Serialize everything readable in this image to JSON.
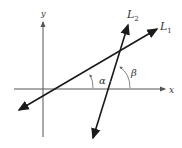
{
  "diagram": {
    "type": "coordinate-geometry",
    "axes": {
      "x_label": "x",
      "y_label": "y",
      "color": "#555555"
    },
    "lines": [
      {
        "name": "L1",
        "label_main": "L",
        "label_sub": "1",
        "color": "#1a1a1a"
      },
      {
        "name": "L2",
        "label_main": "L",
        "label_sub": "2",
        "color": "#1a1a1a"
      }
    ],
    "angles": [
      {
        "name": "alpha",
        "symbol": "α",
        "description": "angle between x-axis and L1"
      },
      {
        "name": "beta",
        "symbol": "β",
        "description": "angle between x-axis and L2"
      }
    ]
  }
}
